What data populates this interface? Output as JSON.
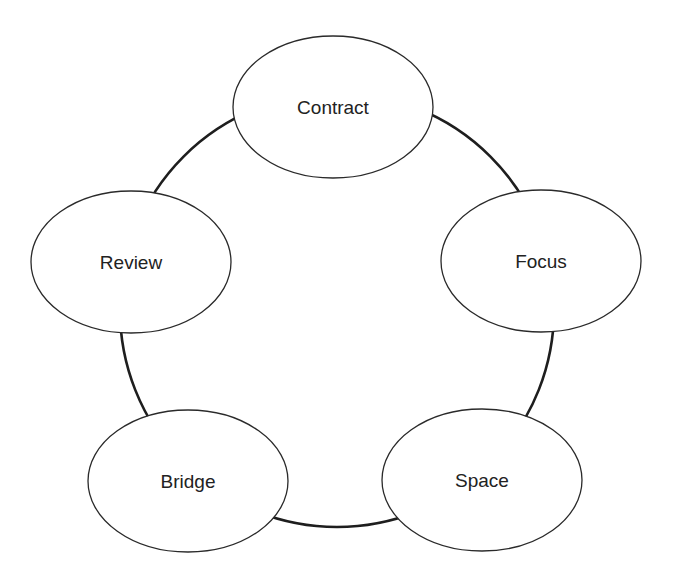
{
  "diagram": {
    "type": "cycle",
    "ring": {
      "cx": 337,
      "cy": 310,
      "r": 217
    },
    "nodes": [
      {
        "id": "contract",
        "label": "Contract",
        "cx": 333,
        "cy": 107,
        "rx": 100,
        "ry": 71
      },
      {
        "id": "focus",
        "label": "Focus",
        "cx": 541,
        "cy": 261,
        "rx": 100,
        "ry": 71
      },
      {
        "id": "space",
        "label": "Space",
        "cx": 482,
        "cy": 480,
        "rx": 100,
        "ry": 71
      },
      {
        "id": "bridge",
        "label": "Bridge",
        "cx": 188,
        "cy": 481,
        "rx": 100,
        "ry": 71
      },
      {
        "id": "review",
        "label": "Review",
        "cx": 131,
        "cy": 262,
        "rx": 100,
        "ry": 71
      }
    ],
    "sequence": [
      "Contract",
      "Focus",
      "Space",
      "Bridge",
      "Review"
    ]
  }
}
